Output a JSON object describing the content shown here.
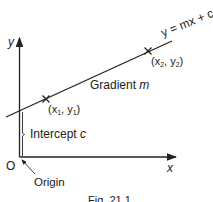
{
  "figure": {
    "type": "straight-line-graph",
    "colors": {
      "ink": "#222222",
      "background": "#ffffff"
    },
    "axes": {
      "x_label": "x",
      "y_label": "y",
      "origin_label": "O"
    },
    "line": {
      "equation_label": "y = mx + c",
      "gradient_label_text": "Gradient ",
      "gradient_label_var": "m"
    },
    "points": [
      {
        "label_open": "(x",
        "sub1": "1",
        "sep": ", y",
        "sub2": "1",
        "label_close": ")"
      },
      {
        "label_open": "(x",
        "sub1": "2",
        "sep": ", y",
        "sub2": "2",
        "label_close": ")"
      }
    ],
    "intercept": {
      "text": "Intercept ",
      "var": "c"
    },
    "origin_annotation": "Origin",
    "caption": "Fig. 21.1"
  }
}
